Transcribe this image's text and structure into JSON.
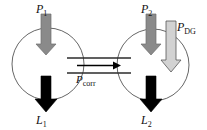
{
  "figure": {
    "type": "schematic-diagram",
    "title": "",
    "background_color": "#ffffff"
  },
  "labels": {
    "p1": {
      "base": "P",
      "sub": "1",
      "full": "P1"
    },
    "p2": {
      "base": "P",
      "sub": "2",
      "full": "P2"
    },
    "pdg": {
      "base": "P",
      "sub": "DG",
      "full": "PDG"
    },
    "pcorr": {
      "base": "P",
      "sub": "corr",
      "full": "Pcorr"
    },
    "l1": {
      "base": "L",
      "sub": "1",
      "full": "L1"
    },
    "l2": {
      "base": "L",
      "sub": "2",
      "full": "L2"
    }
  },
  "colors": {
    "stroke": "#4a4a4a",
    "outline": "#1a1a1a",
    "arrow_gray": "#888888",
    "arrow_gray_dark": "#767676",
    "arrow_light": "#cfcfcf",
    "arrow_black": "#000000",
    "text": "#111111",
    "pipe": "#2b2b2b"
  },
  "nodes": [
    {
      "name": "bus-1",
      "cx": 48,
      "cy": 64,
      "r": 36
    },
    {
      "name": "bus-2",
      "cx": 153,
      "cy": 65,
      "r": 36
    }
  ],
  "arrows": {
    "p1_in": {
      "name": "p1-arrow",
      "color": "#888888",
      "direction": "down",
      "x": 46,
      "y_top": 14,
      "y_tip": 54
    },
    "p2_in": {
      "name": "p2-arrow",
      "color": "#888888",
      "direction": "down",
      "x": 151,
      "y_top": 14,
      "y_tip": 54
    },
    "pdg_in": {
      "name": "pdg-arrow",
      "color": "#cfcfcf",
      "direction": "down",
      "x": 171,
      "y_top": 21,
      "y_tip": 71
    },
    "l1_out": {
      "name": "l1-arrow",
      "color": "#000000",
      "direction": "down",
      "x": 46,
      "y_top": 76,
      "y_tip": 112
    },
    "l2_out": {
      "name": "l2-arrow",
      "color": "#000000",
      "direction": "down",
      "x": 151,
      "y_top": 76,
      "y_tip": 112
    },
    "pcorr_flow": {
      "name": "pcorr-arrow",
      "color": "#000000",
      "direction": "right",
      "x_start": 77,
      "x_tip": 118,
      "y": 65
    }
  },
  "pipe": {
    "name": "tie-line",
    "x_start": 67,
    "x_end": 131,
    "y_top": 58,
    "y_bottom": 73
  }
}
